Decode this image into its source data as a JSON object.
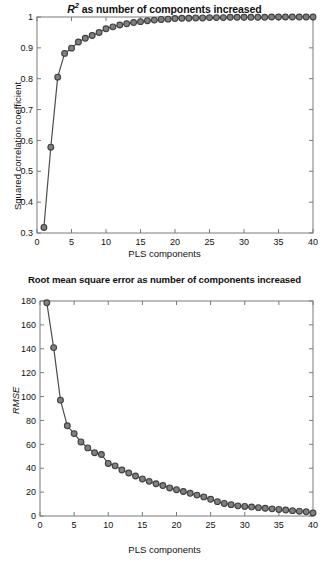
{
  "figure": {
    "background": "#ffffff",
    "line_color": "#4d4d4d",
    "marker_fill": "#808080",
    "marker_edge": "#404040",
    "axis_color": "#7a7a7a"
  },
  "panels": [
    {
      "id": "r2",
      "title_prefix": "R",
      "title_sup": "2",
      "title_rest": " as number of components increased",
      "title_plain": "R2 as number of components increased",
      "xlabel": "PLS components",
      "ylabel": "Squared correlation coefficient",
      "ylabel_italic": false
    },
    {
      "id": "rmse",
      "title_plain": "Root mean square error as number of components increased",
      "xlabel": "PLS components",
      "ylabel": "RMSE",
      "ylabel_italic": true
    }
  ],
  "chart_data": [
    {
      "type": "line",
      "title": "R2 as number of components increased",
      "xlabel": "PLS components",
      "ylabel": "Squared correlation coefficient",
      "xlim": [
        0,
        40
      ],
      "ylim": [
        0.3,
        1.0
      ],
      "xticks": [
        0,
        5,
        10,
        15,
        20,
        25,
        30,
        35,
        40
      ],
      "yticks": [
        0.3,
        0.4,
        0.5,
        0.6,
        0.7,
        0.8,
        0.9,
        1
      ],
      "ytick_labels": [
        "0.3",
        "0.4",
        "0.5",
        "0.6",
        "0.7",
        "0.8",
        "0.9",
        "1"
      ],
      "xtick_labels": [
        "0",
        "5",
        "10",
        "15",
        "20",
        "25",
        "30",
        "35",
        "40"
      ],
      "grid": false,
      "legend": null,
      "marker": "circle",
      "x": [
        1,
        2,
        3,
        4,
        5,
        6,
        7,
        8,
        9,
        10,
        11,
        12,
        13,
        14,
        15,
        16,
        17,
        18,
        19,
        20,
        21,
        22,
        23,
        24,
        25,
        26,
        27,
        28,
        29,
        30,
        31,
        32,
        33,
        34,
        35,
        36,
        37,
        38,
        39,
        40
      ],
      "values": [
        0.318,
        0.578,
        0.805,
        0.882,
        0.899,
        0.919,
        0.931,
        0.94,
        0.95,
        0.962,
        0.968,
        0.974,
        0.978,
        0.982,
        0.985,
        0.988,
        0.99,
        0.992,
        0.993,
        0.995,
        0.996,
        0.996,
        0.997,
        0.997,
        0.998,
        0.998,
        0.998,
        0.999,
        0.999,
        0.999,
        0.999,
        0.999,
        0.999,
        1.0,
        1.0,
        1.0,
        1.0,
        1.0,
        1.0,
        1.0
      ]
    },
    {
      "type": "line",
      "title": "Root mean square error as number of components increased",
      "xlabel": "PLS components",
      "ylabel": "RMSE",
      "xlim": [
        0,
        40
      ],
      "ylim": [
        0,
        180
      ],
      "xticks": [
        0,
        5,
        10,
        15,
        20,
        25,
        30,
        35,
        40
      ],
      "yticks": [
        0,
        20,
        40,
        60,
        80,
        100,
        120,
        140,
        160,
        180
      ],
      "ytick_labels": [
        "0",
        "20",
        "40",
        "60",
        "80",
        "100",
        "120",
        "140",
        "160",
        "180"
      ],
      "xtick_labels": [
        "0",
        "5",
        "10",
        "15",
        "20",
        "25",
        "30",
        "35",
        "40"
      ],
      "grid": false,
      "legend": null,
      "marker": "circle",
      "x": [
        1,
        2,
        3,
        4,
        5,
        6,
        7,
        8,
        9,
        10,
        11,
        12,
        13,
        14,
        15,
        16,
        17,
        18,
        19,
        20,
        21,
        22,
        23,
        24,
        25,
        26,
        27,
        28,
        29,
        30,
        31,
        32,
        33,
        34,
        35,
        36,
        37,
        38,
        39,
        40
      ],
      "values": [
        178.5,
        141.0,
        97.0,
        75.5,
        69.0,
        62.0,
        57.0,
        53.0,
        51.5,
        44.0,
        42.0,
        38.5,
        36.0,
        33.5,
        31.0,
        29.0,
        27.0,
        25.5,
        23.5,
        22.0,
        20.5,
        19.0,
        17.5,
        16.0,
        14.0,
        12.0,
        10.5,
        9.5,
        8.5,
        8.0,
        7.5,
        7.0,
        6.5,
        6.0,
        5.5,
        5.0,
        4.5,
        4.0,
        3.5,
        2.5
      ]
    }
  ]
}
